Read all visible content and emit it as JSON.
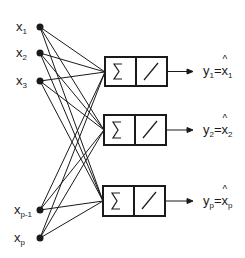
{
  "diagram": {
    "type": "linear autoassociative network",
    "inputs": [
      {
        "name": "x",
        "sub": "1",
        "y": 34
      },
      {
        "name": "x",
        "sub": "2",
        "y": 61
      },
      {
        "name": "x",
        "sub": "3",
        "y": 88
      },
      {
        "name": "x",
        "sub": "p-1",
        "y": 210
      },
      {
        "name": "x",
        "sub": "p",
        "y": 237
      }
    ],
    "units": [
      {
        "sum_symbol": "Σ",
        "activation": "linear",
        "output": {
          "y": "y",
          "ysub": "1",
          "x": "x",
          "xsub": "1"
        }
      },
      {
        "sum_symbol": "Σ",
        "activation": "linear",
        "output": {
          "y": "y",
          "ysub": "2",
          "x": "x",
          "xsub": "2"
        }
      },
      {
        "sum_symbol": "Σ",
        "activation": "linear",
        "output": {
          "y": "y",
          "ysub": "p",
          "x": "x",
          "xsub": "p"
        }
      }
    ],
    "colors": {
      "stroke": "#1a1a1a",
      "background": "#ffffff"
    }
  }
}
